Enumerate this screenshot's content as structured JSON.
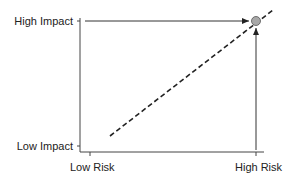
{
  "diagram": {
    "y_axis": {
      "top_label": "High Impact",
      "bottom_label": "Low Impact"
    },
    "x_axis": {
      "left_label": "Low Risk",
      "right_label": "High Risk"
    },
    "point": {
      "description": "High Risk / High Impact",
      "color": "#a0a0a0"
    },
    "trend_line": {
      "style": "dashed",
      "color": "#222222"
    },
    "line_color": "#333333"
  }
}
